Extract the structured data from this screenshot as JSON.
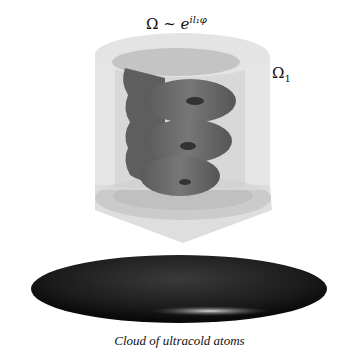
{
  "diagram": {
    "title_equation": {
      "lhs": "Ω",
      "relation": "~",
      "base": "e",
      "exponent": "il₁φ"
    },
    "beam_label": {
      "symbol": "Ω",
      "subscript": "1"
    },
    "caption": "Cloud of ultracold atoms",
    "elements": [
      {
        "name": "laser-beam-cylinder",
        "description": "translucent light grey cylinder with cone tip"
      },
      {
        "name": "helical-phase-front",
        "description": "dark grey helix (optical vortex)"
      },
      {
        "name": "atom-cloud",
        "description": "dark ellipsoid with highlight"
      }
    ],
    "colors": {
      "cylinder": "#d9d9d9",
      "helix": "#6b6b6b",
      "cloud": "#1a1a1a",
      "highlight": "#dddddd"
    }
  }
}
